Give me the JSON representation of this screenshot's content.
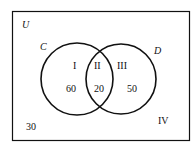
{
  "diagram": {
    "type": "venn",
    "universe_label": "U",
    "sets": [
      {
        "label": "C"
      },
      {
        "label": "D"
      }
    ],
    "regions": [
      {
        "roman": "I",
        "value": "60"
      },
      {
        "roman": "II",
        "value": "20"
      },
      {
        "roman": "III",
        "value": "50"
      },
      {
        "roman": "IV",
        "value": "30"
      }
    ]
  }
}
